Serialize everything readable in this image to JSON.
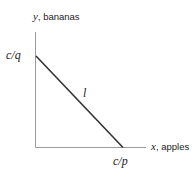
{
  "diagram": {
    "type": "budget-line",
    "y_axis": {
      "variable": "y",
      "label": "bananas"
    },
    "x_axis": {
      "variable": "x",
      "label": "apples"
    },
    "y_intercept_label": "c/q",
    "x_intercept_label": "c/p",
    "line_label": "l",
    "colors": {
      "axis": "#9a9a9a",
      "line": "#333333",
      "text": "#222222"
    }
  }
}
